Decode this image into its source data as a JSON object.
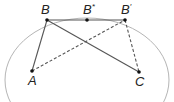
{
  "diagram": {
    "ellipse": {
      "cx": 87,
      "cy": 80,
      "rx": 82,
      "ry": 62,
      "color": "#b5b5b5"
    },
    "points": {
      "B": {
        "label": "B",
        "sup": "",
        "x": 47,
        "y": 20,
        "lx": 41,
        "ly": 14
      },
      "Bs": {
        "label": "B",
        "sup": "*",
        "x": 87,
        "y": 20,
        "lx": 83,
        "ly": 14
      },
      "Bp": {
        "label": "B",
        "sup": "′",
        "x": 125,
        "y": 20,
        "lx": 121,
        "ly": 14
      },
      "A": {
        "label": "A",
        "sup": "",
        "x": 32,
        "y": 71,
        "lx": 28,
        "ly": 85
      },
      "C": {
        "label": "C",
        "sup": "",
        "x": 139,
        "y": 72,
        "lx": 135,
        "ly": 86
      }
    },
    "solid_segments": [
      [
        "B",
        "Bp"
      ],
      [
        "B",
        "A"
      ],
      [
        "B",
        "C"
      ]
    ],
    "dashed_segments": [
      [
        "A",
        "Bp"
      ],
      [
        "Bp",
        "C"
      ]
    ],
    "line_color": "#555555",
    "point_color": "#111111"
  }
}
